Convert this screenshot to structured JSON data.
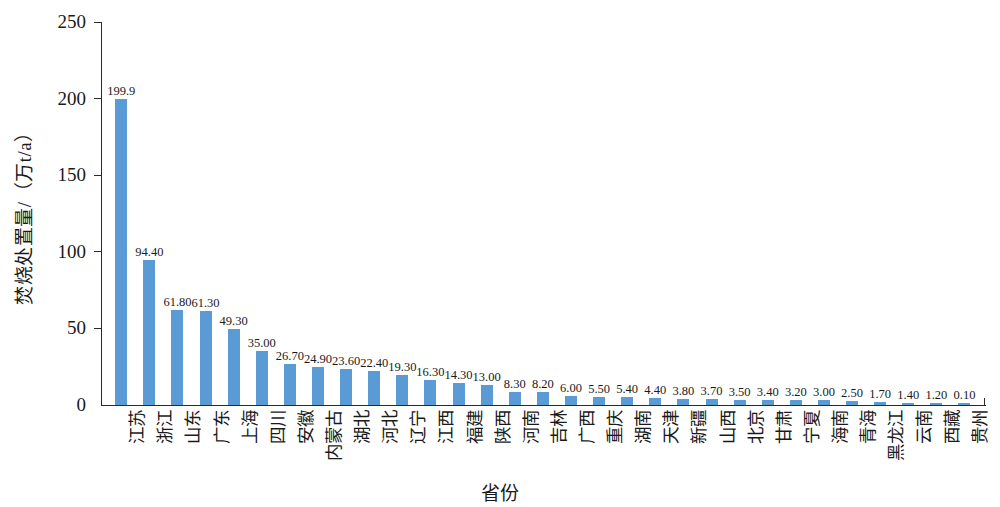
{
  "chart_data": {
    "type": "bar",
    "title": "",
    "xlabel": "省份",
    "ylabel": "焚烧处置量/（万t/a）",
    "ylim": [
      0,
      250
    ],
    "yticks": [
      "0",
      "50",
      "100",
      "150",
      "200",
      "250"
    ],
    "grid": false,
    "legend": null,
    "bar_color": "#5b9bd5",
    "axis_color": "#2b2b2b",
    "categories": [
      "江苏",
      "浙江",
      "山东",
      "广东",
      "上海",
      "四川",
      "安徽",
      "内蒙古",
      "湖北",
      "河北",
      "辽宁",
      "江西",
      "福建",
      "陕西",
      "河南",
      "吉林",
      "广西",
      "重庆",
      "湖南",
      "天津",
      "新疆",
      "山西",
      "北京",
      "甘肃",
      "宁夏",
      "海南",
      "青海",
      "黑龙江",
      "云南",
      "西藏",
      "贵州"
    ],
    "values": [
      199.9,
      94.4,
      61.8,
      61.3,
      49.3,
      35.0,
      26.7,
      24.9,
      23.6,
      22.4,
      19.3,
      16.3,
      14.3,
      13.0,
      8.3,
      8.2,
      6.0,
      5.5,
      5.4,
      4.4,
      3.8,
      3.7,
      3.5,
      3.4,
      3.2,
      3.0,
      2.5,
      1.7,
      1.4,
      1.2,
      0.1
    ],
    "value_labels": [
      "199.9",
      "94.40",
      "61.80",
      "61.30",
      "49.30",
      "35.00",
      "26.70",
      "24.90",
      "23.60",
      "22.40",
      "19.30",
      "16.30",
      "14.30",
      "13.00",
      "8.30",
      "8.20",
      "6.00",
      "5.50",
      "5.40",
      "4.40",
      "3.80",
      "3.70",
      "3.50",
      "3.40",
      "3.20",
      "3.00",
      "2.50",
      "1.70",
      "1.40",
      "1.20",
      "0.10"
    ]
  }
}
